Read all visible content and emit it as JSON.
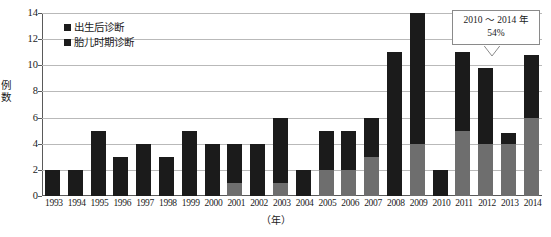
{
  "chart_data": {
    "type": "bar",
    "title": "",
    "subtitle": "",
    "xlabel": "（年）",
    "ylabel": "例数",
    "ylim": [
      0,
      14
    ],
    "yticks": [
      0,
      2,
      4,
      6,
      8,
      10,
      12,
      14
    ],
    "grid": true,
    "stacked": true,
    "legend_position": "top-left",
    "categories": [
      "1993",
      "1994",
      "1995",
      "1996",
      "1997",
      "1998",
      "1999",
      "2000",
      "2001",
      "2002",
      "2003",
      "2004",
      "2005",
      "2006",
      "2007",
      "2008",
      "2009",
      "2010",
      "2011",
      "2012",
      "2013",
      "2014"
    ],
    "series": [
      {
        "name": "胎儿时期诊断",
        "color": "#6e6e6e",
        "values": [
          0,
          0,
          0,
          0,
          0,
          0,
          0,
          0,
          1,
          0,
          1,
          0,
          2,
          2,
          3,
          0,
          4,
          0,
          5,
          4,
          4,
          6
        ]
      },
      {
        "name": "出生后诊断",
        "color": "#1b1b1b",
        "values": [
          2,
          2,
          5,
          3,
          4,
          3,
          5,
          4,
          3,
          4,
          5,
          2,
          3,
          3,
          3,
          11,
          10,
          2,
          6,
          5.8,
          0.8,
          4.8
        ]
      }
    ],
    "totals": [
      2,
      2,
      5,
      3,
      4,
      3,
      5,
      4,
      4,
      4,
      6,
      2,
      5,
      5,
      6,
      11,
      14,
      2,
      11,
      9.8,
      4.8,
      10.8
    ],
    "annotations": [
      {
        "name": "period-callout",
        "line1": "2010 ～ 2014 年",
        "line2": "54%",
        "points_to": "2013"
      }
    ]
  },
  "legend": {
    "items": [
      {
        "label": "出生后诊断",
        "swatch_color": "#1b1b1b"
      },
      {
        "label": "胎儿时期诊断",
        "swatch_color": "#1b1b1b"
      }
    ]
  },
  "axes": {
    "y": {
      "label": "例数",
      "ticks": [
        "14",
        "12",
        "10",
        "8",
        "6",
        "4",
        "2",
        "0"
      ]
    },
    "x": {
      "label": "（年）",
      "ticks": [
        "1993",
        "1994",
        "1995",
        "1996",
        "1997",
        "1998",
        "1999",
        "2000",
        "2001",
        "2002",
        "2003",
        "2004",
        "2005",
        "2006",
        "2007",
        "2008",
        "2009",
        "2010",
        "2011",
        "2012",
        "2013",
        "2014"
      ]
    }
  },
  "callout": {
    "line1": "2010 ～ 2014 年",
    "line2": "54%"
  },
  "colors": {
    "postnatal": "#1b1b1b",
    "fetal": "#6e6e6e",
    "gridline": "#b9b9b9",
    "axis": "#5a5a5a",
    "background": "#ffffff"
  }
}
